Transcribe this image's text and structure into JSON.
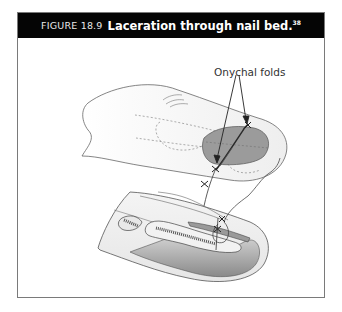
{
  "figure": {
    "number": "FIGURE 18.9",
    "title": "Laceration through nail bed.",
    "reference": "38",
    "callout_label": "Onychal folds"
  },
  "colors": {
    "header_bg": "#050505",
    "header_text": "#ffffff",
    "border": "#7a7a7a",
    "nail": "#9a9a9a",
    "skin": "#f0f0f0"
  }
}
